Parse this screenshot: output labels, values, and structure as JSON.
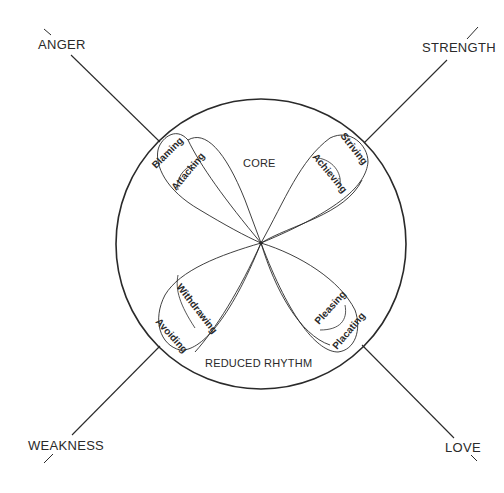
{
  "diagram": {
    "colors": {
      "ink": "#2a2a2a",
      "background": "#ffffff"
    },
    "circle": {
      "cx": 261,
      "cy": 244,
      "r": 145
    },
    "center_point": {
      "x": 261,
      "y": 243
    },
    "zones": {
      "core": "CORE",
      "reduced_rhythm": "REDUCED RHYTHM"
    },
    "axes": [
      {
        "id": "anger",
        "label": "ANGER",
        "direction": "upper-left"
      },
      {
        "id": "strength",
        "label": "STRENGTH",
        "direction": "upper-right"
      },
      {
        "id": "weakness",
        "label": "WEAKNESS",
        "direction": "lower-left"
      },
      {
        "id": "love",
        "label": "LOVE",
        "direction": "lower-right"
      }
    ],
    "loops": [
      {
        "quadrant": "upper-left",
        "outer": "Blaming",
        "inner": "Attacking"
      },
      {
        "quadrant": "upper-right",
        "outer": "Striving",
        "inner": "Achieving"
      },
      {
        "quadrant": "lower-left",
        "outer": "Avoiding",
        "inner": "Withdrawing"
      },
      {
        "quadrant": "lower-right",
        "outer": "Placating",
        "inner": "Pleasing"
      }
    ]
  }
}
